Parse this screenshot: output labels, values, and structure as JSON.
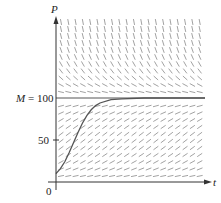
{
  "chart_data": {
    "type": "line",
    "title": "",
    "subtitle": "Direction field for logistic equation dP/dt = kP(1 - P/M)",
    "xlabel": "t",
    "ylabel": "P",
    "yticks": [
      {
        "value": 0,
        "label": "0"
      },
      {
        "value": 50,
        "label": "50"
      },
      {
        "value": 100,
        "label": "M = 100"
      }
    ],
    "ylim": [
      0,
      200
    ],
    "grid": false,
    "legend": null,
    "carrying_capacity": {
      "label": "M = 100",
      "value": 100
    },
    "direction_field": {
      "columns": 20,
      "rows": 23,
      "k": 0.08,
      "M": 100
    },
    "series": [
      {
        "name": "solution curve",
        "x": [
          0,
          2,
          4,
          6,
          8,
          10,
          12,
          14,
          16,
          18,
          20,
          25,
          30,
          40,
          60
        ],
        "values": [
          10,
          16,
          24,
          35,
          47,
          59,
          70,
          79,
          86,
          91,
          94,
          98,
          99,
          100,
          100
        ]
      }
    ],
    "colors": {
      "axis": "#333333",
      "field": "#8a8a8a",
      "curve": "#555555",
      "equilibrium": "#555555"
    }
  },
  "labels": {
    "y_axis": "P",
    "x_axis": "t",
    "origin": "0",
    "tick_50": "50",
    "tick_M_var": "M",
    "tick_M_eq": "= 100"
  }
}
